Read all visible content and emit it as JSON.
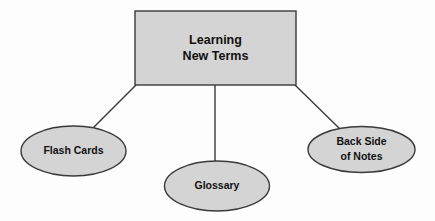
{
  "diagram": {
    "type": "concept-map",
    "background_color": "#fdfdfd",
    "shape_fill_color": "#d4d4d4",
    "shape_stroke_color": "#3a3a3a",
    "text_color": "#111111",
    "root": {
      "shape": "rectangle",
      "line1": "Learning",
      "line2": "New Terms"
    },
    "branches": [
      {
        "shape": "ellipse",
        "line1": "Flash Cards",
        "line2": ""
      },
      {
        "shape": "ellipse",
        "line1": "Glossary",
        "line2": ""
      },
      {
        "shape": "ellipse",
        "line1": "Back Side",
        "line2": "of Notes"
      }
    ]
  }
}
